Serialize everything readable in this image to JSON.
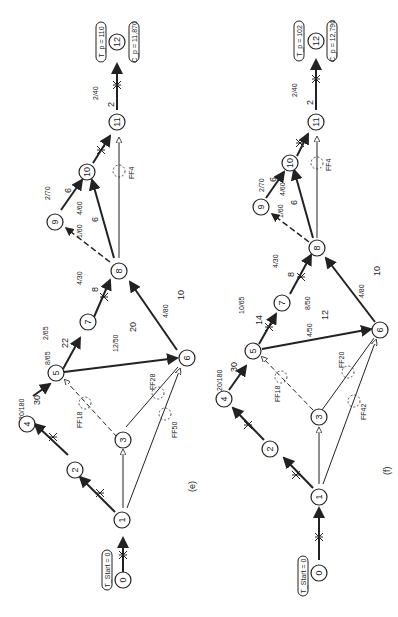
{
  "figure": {
    "orientation": "rotated-90-ccw",
    "panels": [
      {
        "id": "e",
        "caption": "(e)",
        "start_label": "T_Start = 0",
        "project_time_label": "T_p = 110",
        "project_cost_label": "C_p = 11,870",
        "nodes": [
          "0",
          "1",
          "2",
          "3",
          "4",
          "5",
          "6",
          "7",
          "8",
          "9",
          "10",
          "11",
          "12"
        ],
        "activity_labels": [
          {
            "edge": "4-5",
            "duration": "30",
            "cost_rate": "20/180"
          },
          {
            "edge": "5-7",
            "duration": "22",
            "cost_rate": "8/65",
            "cost_rate2": "2/65"
          },
          {
            "edge": "5-6",
            "duration": "20",
            "cost_rate": "12/50"
          },
          {
            "edge": "7-8",
            "duration": "8",
            "cost_rate": "4/30"
          },
          {
            "edge": "6-8",
            "duration": "10",
            "cost_rate": "4/80"
          },
          {
            "edge": "8-10",
            "duration": "6",
            "cost_rate": "4/60",
            "cost_rate2": "1/60"
          },
          {
            "edge": "9-10",
            "duration": "6",
            "cost_rate": "2/70"
          },
          {
            "edge": "11-12",
            "duration": "2",
            "cost_rate": "2/40"
          }
        ],
        "free_floats": [
          "FF18",
          "FF28",
          "FF50",
          "FF4"
        ]
      },
      {
        "id": "f",
        "caption": "(f)",
        "start_label": "T_Start = 0",
        "project_time_label": "T_p = 102",
        "project_cost_label": "C_p = 12,790",
        "nodes": [
          "0",
          "1",
          "2",
          "3",
          "4",
          "5",
          "6",
          "7",
          "8",
          "9",
          "10",
          "11",
          "12"
        ],
        "activity_labels": [
          {
            "edge": "4-5",
            "duration": "30",
            "cost_rate": "20/180"
          },
          {
            "edge": "5-7",
            "duration": "14",
            "cost_rate": "10/65"
          },
          {
            "edge": "5-6",
            "duration": "12",
            "cost_rate": "4/50",
            "cost_rate2": "8/50"
          },
          {
            "edge": "7-8",
            "duration": "8",
            "cost_rate": "4/30"
          },
          {
            "edge": "6-8",
            "duration": "10",
            "cost_rate": "4/80"
          },
          {
            "edge": "8-10",
            "duration": "6",
            "cost_rate": "4/60",
            "cost_rate2": "1/60"
          },
          {
            "edge": "9-10",
            "duration": "6",
            "cost_rate": "2/70"
          },
          {
            "edge": "11-12",
            "duration": "2",
            "cost_rate": "2/40"
          }
        ],
        "free_floats": [
          "FF18",
          "FF20",
          "FF42",
          "FF4"
        ]
      }
    ]
  }
}
